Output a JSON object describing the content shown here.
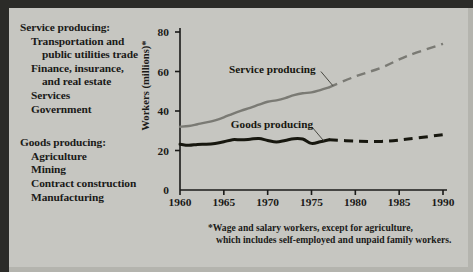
{
  "figure": {
    "background_color": "#c6c6c1",
    "frame_color": "#2b2b28"
  },
  "legend": {
    "service": {
      "heading": "Service producing:",
      "items": [
        "Transportation and",
        "public utilities trade",
        "Finance, insurance,",
        "and real estate",
        "Services",
        "Government"
      ]
    },
    "goods": {
      "heading": "Goods producing:",
      "items": [
        "Agriculture",
        "Mining",
        "Contract construction",
        "Manufacturing"
      ]
    }
  },
  "footnote": {
    "line1": "*Wage and salary workers, except for agriculture,",
    "line2": "which includes self-employed and unpaid family workers."
  },
  "chart_data": {
    "type": "line",
    "title": "",
    "xlabel": "",
    "ylabel": "Workers (millions)*",
    "xlim": [
      1960,
      1990
    ],
    "ylim": [
      0,
      80
    ],
    "xticks": [
      1960,
      1965,
      1970,
      1975,
      1980,
      1985,
      1990
    ],
    "yticks": [
      0,
      20,
      40,
      60,
      80
    ],
    "grid": false,
    "legend_position": "inline-annotations",
    "series": [
      {
        "name": "Service producing",
        "color": "#7a7a74",
        "style": "solid-then-dashed",
        "dash_starts_at": 1977,
        "x": [
          1960,
          1961,
          1962,
          1963,
          1964,
          1965,
          1966,
          1967,
          1968,
          1969,
          1970,
          1971,
          1972,
          1973,
          1974,
          1975,
          1976,
          1977,
          1980,
          1983,
          1986,
          1990
        ],
        "values": [
          32,
          32.4,
          33.3,
          34.2,
          35.3,
          36.8,
          38.6,
          40.2,
          41.6,
          43.2,
          44.7,
          45.4,
          46.5,
          48.0,
          49.0,
          49.4,
          50.6,
          52.0,
          57.5,
          62.0,
          68.0,
          74.0
        ]
      },
      {
        "name": "Goods producing",
        "color": "#17170f",
        "style": "solid-then-dashed",
        "dash_starts_at": 1977,
        "x": [
          1960,
          1961,
          1962,
          1963,
          1964,
          1965,
          1966,
          1967,
          1968,
          1969,
          1970,
          1971,
          1972,
          1973,
          1974,
          1975,
          1976,
          1977,
          1980,
          1983,
          1986,
          1990
        ],
        "values": [
          23.2,
          22.6,
          23.1,
          23.2,
          23.6,
          24.4,
          25.5,
          25.4,
          25.7,
          26.1,
          25.1,
          24.3,
          25.1,
          26.0,
          25.8,
          23.6,
          24.4,
          25.4,
          24.8,
          24.6,
          25.8,
          28.0
        ]
      }
    ],
    "annotations": [
      {
        "text": "Service producing",
        "x": 1965.6,
        "y": 61
      },
      {
        "text": "Goods producing",
        "x": 1965.8,
        "y": 33
      }
    ]
  }
}
